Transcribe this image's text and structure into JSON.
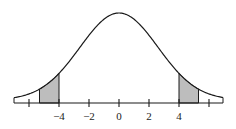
{
  "figure": {
    "type": "normal-distribution-curve",
    "colors": {
      "curve": "#1a1a1a",
      "shade": "#bdbdbd",
      "axis": "#1a1a1a",
      "background": "#ffffff"
    },
    "axis": {
      "tick_values": [
        -6,
        -4,
        -2,
        0,
        2,
        4,
        6
      ],
      "labels": [
        {
          "value": -4,
          "text": "−4"
        },
        {
          "value": -2,
          "text": "−2"
        },
        {
          "value": 0,
          "text": "0"
        },
        {
          "value": 2,
          "text": "2"
        },
        {
          "value": 4,
          "text": "4"
        }
      ]
    },
    "shaded_regions": [
      {
        "from": -5.3,
        "to": -4,
        "side": "left"
      },
      {
        "from": 4,
        "to": 5.3,
        "side": "right"
      }
    ]
  },
  "chart_data": {
    "type": "area",
    "title": "",
    "xlabel": "",
    "ylabel": "",
    "x_ticks": [
      -6,
      -4,
      -2,
      0,
      2,
      4,
      6
    ],
    "x_tick_labels": [
      "−4",
      "−2",
      "0",
      "2",
      "4"
    ],
    "xlim": [
      -7,
      7
    ],
    "series": [
      {
        "name": "density",
        "shape": "bell curve centered at 0",
        "center": 0
      }
    ],
    "shaded": [
      [
        -5.3,
        -4
      ],
      [
        4,
        5.3
      ]
    ],
    "grid": false,
    "legend": false
  }
}
